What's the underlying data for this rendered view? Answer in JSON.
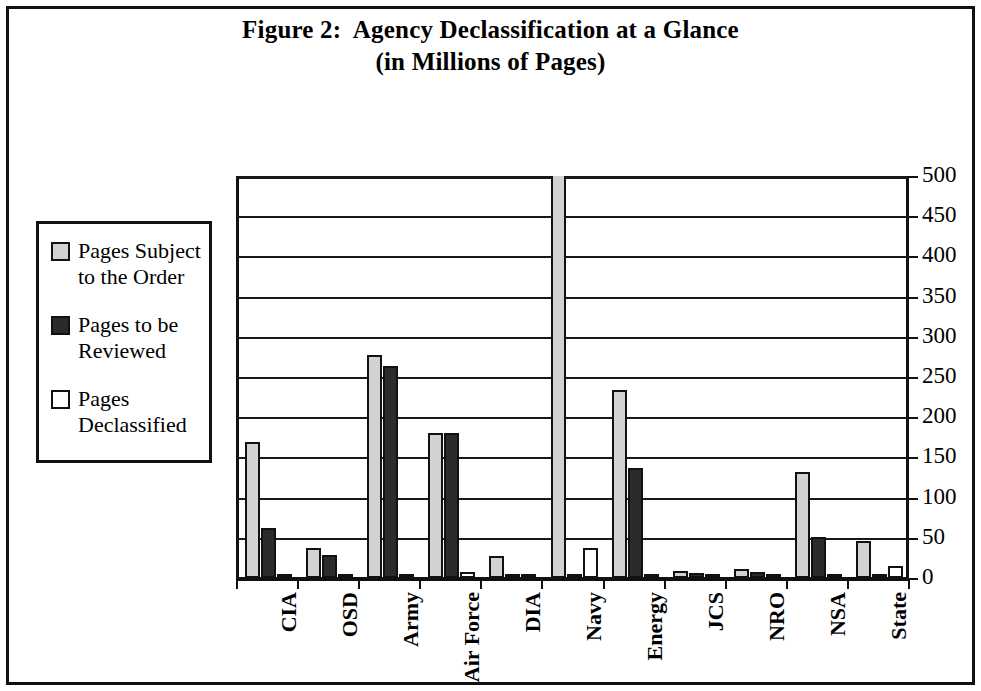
{
  "figure": {
    "title_line1": "Figure 2:  Agency Declassification at a Glance",
    "title_line2": "(in Millions of Pages)"
  },
  "legend": {
    "items": [
      {
        "label": "Pages Subject\nto the Order",
        "swatch": "light-gray-swatch",
        "color": "#d2d2d2"
      },
      {
        "label": "Pages to be\nReviewed",
        "swatch": "dark-gray-swatch",
        "color": "#2b2b2b"
      },
      {
        "label": "Pages\nDeclassified",
        "swatch": "white-swatch",
        "color": "#ffffff"
      }
    ]
  },
  "chart_data": {
    "type": "bar",
    "title": "Figure 2:  Agency Declassification at a Glance (in Millions of Pages)",
    "xlabel": "",
    "ylabel": "",
    "ylim": [
      0,
      500
    ],
    "yticks": [
      0,
      50,
      100,
      150,
      200,
      250,
      300,
      350,
      400,
      450,
      500
    ],
    "grid": true,
    "legend_position": "left",
    "categories": [
      "CIA",
      "OSD",
      "Army",
      "Air Force",
      "DIA",
      "Navy",
      "Energy",
      "JCS",
      "NRO",
      "NSA",
      "State"
    ],
    "series": [
      {
        "name": "Pages Subject to the Order",
        "color": "#d2d2d2",
        "values": [
          169,
          37,
          277,
          180,
          27,
          520,
          234,
          9,
          11,
          132,
          46
        ],
        "clipped": [
          false,
          false,
          false,
          false,
          false,
          true,
          false,
          false,
          false,
          false,
          false
        ]
      },
      {
        "name": "Pages to be Reviewed",
        "color": "#2b2b2b",
        "values": [
          62,
          29,
          264,
          180,
          2,
          2,
          137,
          6,
          8,
          51,
          3
        ],
        "clipped": [
          false,
          false,
          false,
          false,
          false,
          false,
          false,
          false,
          false,
          false,
          false
        ]
      },
      {
        "name": "Pages Declassified",
        "color": "#ffffff",
        "values": [
          2,
          2,
          2,
          8,
          1,
          37,
          3,
          2,
          2,
          2,
          15
        ],
        "clipped": [
          false,
          false,
          false,
          false,
          false,
          false,
          false,
          false,
          false,
          false,
          false
        ]
      }
    ]
  }
}
